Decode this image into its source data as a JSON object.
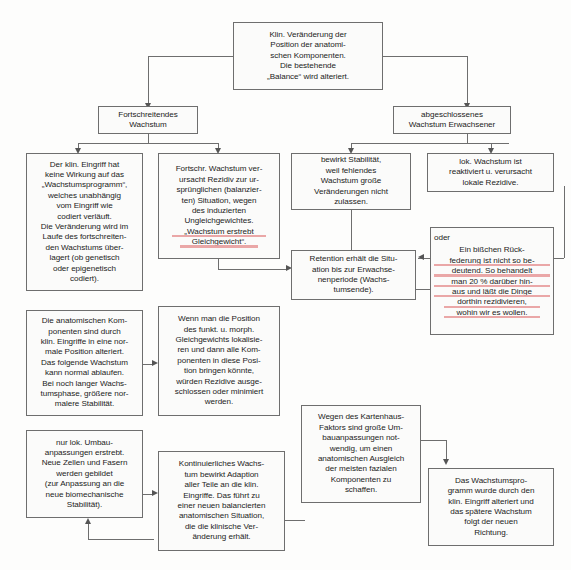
{
  "diagram": {
    "language": "de",
    "accent_marker_color": "#e8a0a0",
    "box_border_color": "#6e6e6e",
    "connector_color": "#6e6e6e",
    "nodes": {
      "root": {
        "id": "klin-veraenderung",
        "lines": [
          "Klin. Veränderung der",
          "Position der anatomi-",
          "schen Komponenten.",
          "Die bestehende",
          "„Balance“ wird alteriert."
        ]
      },
      "left_branch": {
        "id": "fortschreitendes-wachstum",
        "lines": [
          "Fortschreitendes",
          "Wachstum"
        ]
      },
      "right_branch": {
        "id": "abgeschlossenes-wachstum",
        "lines": [
          "abgeschlossenes",
          "Wachstum Erwachsener"
        ]
      },
      "l1": {
        "id": "klin-eingriff-keine-wirkung",
        "lines": [
          "Der klin. Eingriff hat",
          "keine Wirkung auf das",
          "„Wachstumsprogramm“,",
          "welches unabhängig",
          "vom Eingriff wie",
          "codiert verläuft.",
          "Die Veränderung wird im",
          "Laufe des fortschreiten-",
          "den Wachstums über-",
          "lagert (ob genetisch",
          "oder epigenetisch",
          "codiert)."
        ]
      },
      "l2": {
        "id": "fortschr-wachstum-rezidiv",
        "lines": [
          "Fortschr. Wachstum ver-",
          "ursacht Rezidiv zur ur-",
          "sprünglichen (balanzier-",
          "ten) Situation, wegen",
          "des induzierten",
          "Ungleichgewichtes.",
          "„Wachstum erstrebt",
          "Gleichgewicht“."
        ],
        "underlined_lines": [
          6,
          7
        ]
      },
      "r1": {
        "id": "bewirkt-stabilitaet",
        "lines": [
          "bewirkt Stabilität,",
          "weil fehlendes",
          "Wachstum große",
          "Veränderungen nicht",
          "zulassen."
        ]
      },
      "r2": {
        "id": "lok-wachstum-reaktiviert",
        "lines": [
          "lok. Wachstum ist",
          "reaktiviert u. verursacht",
          "lokale Rezidive."
        ]
      },
      "r3": {
        "id": "oder-rueckfederung",
        "label": "oder",
        "lines": [
          "Ein bißchen Rück-",
          "federung ist nicht so be-",
          "deutend. So behandelt",
          "man 20 % darüber hin-",
          "aus und läßt die Dinge",
          "dorthin rezidivieren,",
          "wohin wir es wollen."
        ],
        "underlined_lines": [
          1,
          2,
          3,
          4,
          5,
          6
        ]
      },
      "r4": {
        "id": "retention-erhaelt-situation",
        "lines": [
          "Retention erhält die Situ-",
          "ation bis zur Erwachse-",
          "nenperiode (Wachs-",
          "tumsende)."
        ]
      },
      "l3": {
        "id": "anatomische-komponenten-alteriert",
        "lines": [
          "Die anatomischen Kom-",
          "ponenten sind durch",
          "klin. Eingriffe in eine nor-",
          "male Position alteriert.",
          "Das folgende Wachstum",
          "kann normal ablaufen.",
          "Bei noch langer Wachs-",
          "tumsphase, größere nor-",
          "malere Stabilität."
        ]
      },
      "l4": {
        "id": "position-gleichgewicht-lokalisieren",
        "lines": [
          "Wenn man die Position",
          "des funkt. u. morph.",
          "Gleichgewichts lokalisie-",
          "ren und dann alle Kom-",
          "ponenten in diese Posi-",
          "tion bringen könnte,",
          "würden Rezidive ausge-",
          "schlossen oder minimiert",
          "werden."
        ]
      },
      "l5": {
        "id": "nur-lok-umbauanpassungen",
        "lines": [
          "nur lok. Umbau-",
          "anpassungen erstrebt.",
          "Neue Zellen und Fasern",
          "werden gebildet",
          "(zur Anpassung an die",
          "neue biomechanische",
          "Stabilität)."
        ]
      },
      "l6": {
        "id": "kontinuierliches-wachstum-adaption",
        "lines": [
          "Kontinuierliches Wachs-",
          "tum bewirkt Adaption",
          "aller Teile an die klin.",
          "Eingriffe. Das führt zu",
          "einer neuen balancierten",
          "anatomischen Situation,",
          "die die klinische Ver-",
          "änderung erhält."
        ]
      },
      "r5": {
        "id": "kartenhaus-faktor",
        "lines": [
          "Wegen des Kartenhaus-",
          "Faktors sind große Um-",
          "bauanpassungen not-",
          "wendig, um einen",
          "anatomischen Ausgleich",
          "der meisten fazialen",
          "Komponenten zu",
          "schaffen."
        ]
      },
      "r6": {
        "id": "wachstumsprogramm-alteriert",
        "lines": [
          "Das Wachstumspro-",
          "gramm wurde durch den",
          "klin. Eingriff alteriert und",
          "das spätere Wachstum",
          "folgt der neuen",
          "Richtung."
        ]
      }
    }
  }
}
